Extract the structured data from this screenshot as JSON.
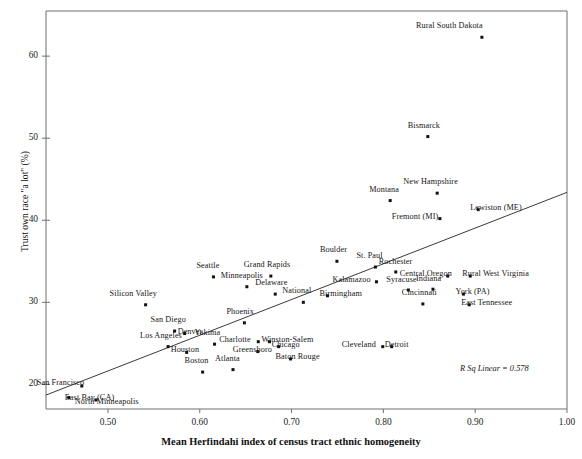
{
  "chart_data": {
    "type": "scatter",
    "title": "",
    "xlabel": "Mean Herfindahi index of census tract ethnic homogeneity",
    "ylabel": "Trust own race \"a lot\" (%)",
    "xlim": [
      0.4325,
      1.0
    ],
    "ylim": [
      17.0,
      65.5
    ],
    "xticks": [
      "0.50",
      "0.60",
      "0.70",
      "0.80",
      "0.90",
      "1.00"
    ],
    "xtick_values": [
      0.5,
      0.6,
      0.7,
      0.8,
      0.9,
      1.0
    ],
    "yticks": [
      "20",
      "30",
      "40",
      "50",
      "60"
    ],
    "ytick_values": [
      20,
      30,
      40,
      50,
      60
    ],
    "grid": false,
    "legend": null,
    "annotation": "R Sq Linear = 0.578",
    "fit_line": {
      "type": "linear",
      "x0": 0.4325,
      "y0": 18.7,
      "x1": 1.0,
      "y1": 43.4
    },
    "point_color": "#111111",
    "line_color": "#3a3a3a",
    "points": [
      {
        "label": "Rural South Dakota",
        "x": 0.9073,
        "y": 62.3,
        "lx": -66,
        "ly": -10
      },
      {
        "label": "Bismarck",
        "x": 0.8484,
        "y": 50.2,
        "lx": -20,
        "ly": -10
      },
      {
        "label": "New Hampshire",
        "x": 0.8586,
        "y": 43.3,
        "lx": -34,
        "ly": -10
      },
      {
        "label": "Montana",
        "x": 0.8074,
        "y": 42.4,
        "lx": -21,
        "ly": -10
      },
      {
        "label": "Lewiston (ME)",
        "x": 0.9033,
        "y": 41.3,
        "lx": -8,
        "ly": -1
      },
      {
        "label": "Fremont (MI)",
        "x": 0.8615,
        "y": 40.2,
        "lx": -48,
        "ly": -1
      },
      {
        "label": "Boulder",
        "x": 0.7494,
        "y": 35.0,
        "lx": -17,
        "ly": -10
      },
      {
        "label": "St. Paul",
        "x": 0.7913,
        "y": 34.3,
        "lx": -19,
        "ly": -10
      },
      {
        "label": "Rochester",
        "x": 0.8135,
        "y": 33.7,
        "lx": -17,
        "ly": -9
      },
      {
        "label": "Grand Rapids",
        "x": 0.6774,
        "y": 33.2,
        "lx": -27,
        "ly": -10
      },
      {
        "label": "Central Oregon",
        "x": 0.8701,
        "y": 33.2,
        "lx": -48,
        "ly": -1
      },
      {
        "label": "Rural West Virginia",
        "x": 0.8946,
        "y": 33.2,
        "lx": -8,
        "ly": -1
      },
      {
        "label": "Seattle",
        "x": 0.6149,
        "y": 33.1,
        "lx": -17,
        "ly": -10
      },
      {
        "label": "Kalamazoo",
        "x": 0.7925,
        "y": 32.5,
        "lx": -44,
        "ly": -1
      },
      {
        "label": "Minneapolis",
        "x": 0.6513,
        "y": 31.9,
        "lx": -26,
        "ly": -10
      },
      {
        "label": "York (PA)",
        "x": 0.8872,
        "y": 31.0,
        "lx": -8,
        "ly": -1
      },
      {
        "label": "Delaware",
        "x": 0.6822,
        "y": 31.0,
        "lx": -20,
        "ly": -10
      },
      {
        "label": "Birmingham",
        "x": 0.7391,
        "y": 30.8,
        "lx": -8,
        "ly": -1
      },
      {
        "label": "Syracuse",
        "x": 0.8272,
        "y": 31.5,
        "lx": -22,
        "ly": -9
      },
      {
        "label": "Indiana",
        "x": 0.854,
        "y": 31.6,
        "lx": -17,
        "ly": -9
      },
      {
        "label": "Cincinnati",
        "x": 0.843,
        "y": 29.8,
        "lx": -21,
        "ly": -10
      },
      {
        "label": "East Tennessee",
        "x": 0.8935,
        "y": 29.7,
        "lx": -8,
        "ly": -1
      },
      {
        "label": "Silicon Valley",
        "x": 0.541,
        "y": 29.7,
        "lx": -36,
        "ly": -10
      },
      {
        "label": "National",
        "x": 0.7128,
        "y": 30.0,
        "lx": -21,
        "ly": -10
      },
      {
        "label": "Phoenix",
        "x": 0.6486,
        "y": 27.5,
        "lx": -18,
        "ly": -10
      },
      {
        "label": "San Diego",
        "x": 0.5726,
        "y": 26.5,
        "lx": -24,
        "ly": -10
      },
      {
        "label": "Denver",
        "x": 0.5835,
        "y": 26.2,
        "lx": -7,
        "ly": -1
      },
      {
        "label": "Winston-Salem",
        "x": 0.6759,
        "y": 25.2,
        "lx": -8,
        "ly": -1
      },
      {
        "label": "Charlotte",
        "x": 0.6637,
        "y": 25.2,
        "lx": -39,
        "ly": -1
      },
      {
        "label": "Yakima",
        "x": 0.6161,
        "y": 24.9,
        "lx": -20,
        "ly": -10
      },
      {
        "label": "Los Angeles",
        "x": 0.5655,
        "y": 24.6,
        "lx": -28,
        "ly": -10
      },
      {
        "label": "Chicago",
        "x": 0.6859,
        "y": 24.6,
        "lx": -7,
        "ly": -1
      },
      {
        "label": "Cleveland",
        "x": 0.7993,
        "y": 24.6,
        "lx": -41,
        "ly": -1
      },
      {
        "label": "Detroit",
        "x": 0.809,
        "y": 24.6,
        "lx": -7,
        "ly": -1
      },
      {
        "label": "Greensboro",
        "x": 0.6632,
        "y": 24.0,
        "lx": -25,
        "ly": -1
      },
      {
        "label": "Houston",
        "x": 0.5857,
        "y": 23.9,
        "lx": -16,
        "ly": -1
      },
      {
        "label": "Baton Rouge",
        "x": 0.6989,
        "y": 23.1,
        "lx": -15,
        "ly": -1
      },
      {
        "label": "Boston",
        "x": 0.6031,
        "y": 21.5,
        "lx": -18,
        "ly": -10
      },
      {
        "label": "Atlanta",
        "x": 0.6362,
        "y": 21.8,
        "lx": -18,
        "ly": -10
      },
      {
        "label": "San Francisco",
        "x": 0.4715,
        "y": 19.8,
        "lx": -45,
        "ly": -2
      },
      {
        "label": "East Bay (CA)",
        "x": 0.4573,
        "y": 18.4,
        "lx": -4,
        "ly": 1
      },
      {
        "label": "North Minneapolis",
        "x": 0.4868,
        "y": 18.1,
        "lx": -21,
        "ly": 3
      }
    ]
  }
}
